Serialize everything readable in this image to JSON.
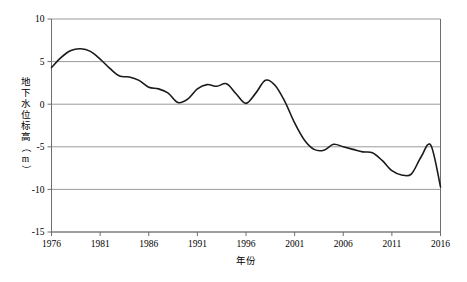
{
  "chart_data": {
    "type": "line",
    "title": "",
    "xlabel": "年份",
    "ylabel": "地下水位标高（m）",
    "ylabel_chars": [
      "地",
      "下",
      "水",
      "位",
      "标",
      "高",
      "（",
      "m",
      "）"
    ],
    "xlim": [
      1976,
      2016
    ],
    "ylim": [
      -15,
      10
    ],
    "x_ticks": [
      1976,
      1981,
      1986,
      1991,
      1996,
      2001,
      2006,
      2011,
      2016
    ],
    "y_ticks": [
      10,
      5,
      0,
      -5,
      -10,
      -15
    ],
    "grid": "horizontal",
    "legend": "none",
    "series": [
      {
        "name": "地下水位标高",
        "color": "#1a1a1a",
        "x": [
          1976,
          1977,
          1978,
          1979,
          1980,
          1981,
          1982,
          1983,
          1984,
          1985,
          1986,
          1987,
          1988,
          1989,
          1990,
          1991,
          1992,
          1993,
          1994,
          1995,
          1996,
          1997,
          1998,
          1999,
          2000,
          2001,
          2002,
          2003,
          2004,
          2005,
          2006,
          2007,
          2008,
          2009,
          2010,
          2011,
          2012,
          2013,
          2014,
          2015,
          2016
        ],
        "values": [
          4.3,
          5.5,
          6.3,
          6.5,
          6.2,
          5.3,
          4.2,
          3.3,
          3.2,
          2.8,
          2.0,
          1.8,
          1.3,
          0.2,
          0.6,
          1.8,
          2.3,
          2.1,
          2.4,
          1.2,
          0.1,
          1.3,
          2.8,
          2.2,
          0.3,
          -2.2,
          -4.2,
          -5.3,
          -5.4,
          -4.7,
          -5.0,
          -5.3,
          -5.6,
          -5.7,
          -6.6,
          -7.8,
          -8.3,
          -8.2,
          -6.2,
          -4.8,
          -9.7
        ]
      }
    ]
  },
  "axes": {
    "x_tick_labels": [
      "1976",
      "1981",
      "1986",
      "1991",
      "1996",
      "2001",
      "2006",
      "2011",
      "2016"
    ],
    "y_tick_labels": [
      "10",
      "5",
      "0",
      "-5",
      "-10",
      "-15"
    ]
  },
  "colors": {
    "line": "#1a1a1a",
    "grid": "#9a9a9a",
    "axis": "#6e6e6e",
    "background": "#ffffff"
  }
}
